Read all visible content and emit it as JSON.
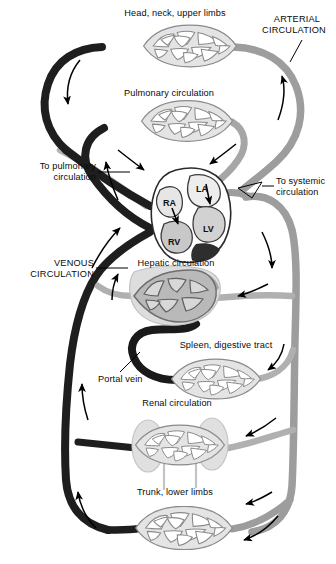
{
  "figure": {
    "title_visible": false,
    "background": "#ffffff"
  },
  "colors": {
    "venous": "#1c1c1c",
    "venous_dark": "#111111",
    "arterial": "#9a9a9a",
    "arterial_light": "#b4b4b4",
    "portal": "#1c1c1c",
    "capillary_fill": "#e2e2e2",
    "capillary_stroke": "#8d8d8d",
    "organ_fill": "#dcdcdc",
    "organ_stroke": "#b0b0b0",
    "heart_outline": "#2a2a2a",
    "chamber_light": "#e6e6e6",
    "chamber_mid": "#c2c2c2",
    "chamber_dark": "#3a3a3a",
    "arrow": "#000000",
    "leader": "#000000",
    "text": "#0b0b0b"
  },
  "labels": {
    "head_neck_upper_limbs": "Head, neck, upper limbs",
    "arterial_circulation_line1": "ARTERIAL",
    "arterial_circulation_line2": "CIRCULATION",
    "pulmonary_circulation": "Pulmonary circulation",
    "to_pulmonary_line1": "To pulmonary",
    "to_pulmonary_line2": "circulation",
    "to_systemic_line1": "To systemic",
    "to_systemic_line2": "circulation",
    "venous_circulation_line1": "VENOUS",
    "venous_circulation_line2": "CIRCULATION",
    "hepatic_circulation": "Hepatic circulation",
    "spleen_digestive_tract": "Spleen, digestive tract",
    "portal_vein": "Portal vein",
    "renal_circulation": "Renal circulation",
    "trunk_lower_limbs": "Trunk, lower limbs"
  },
  "heart": {
    "chambers": [
      {
        "id": "RA",
        "label": "RA",
        "name": "right-atrium"
      },
      {
        "id": "LA",
        "label": "LA",
        "name": "left-atrium"
      },
      {
        "id": "RV",
        "label": "RV",
        "name": "right-ventricle"
      },
      {
        "id": "LV",
        "label": "LV",
        "name": "left-ventricle"
      }
    ]
  },
  "capillary_beds": [
    {
      "name": "head-neck-upper-limbs-capillary-bed",
      "label": "Head, neck, upper limbs"
    },
    {
      "name": "pulmonary-capillary-bed",
      "label": "Pulmonary circulation"
    },
    {
      "name": "hepatic-capillary-bed",
      "label": "Hepatic circulation"
    },
    {
      "name": "spleen-digestive-capillary-bed",
      "label": "Spleen, digestive tract"
    },
    {
      "name": "renal-capillary-bed",
      "label": "Renal circulation"
    },
    {
      "name": "trunk-lower-limbs-capillary-bed",
      "label": "Trunk, lower limbs"
    }
  ],
  "organs": [
    {
      "name": "liver-silhouette",
      "label": "Hepatic circulation"
    },
    {
      "name": "kidney-left-silhouette",
      "label": "Renal circulation"
    },
    {
      "name": "kidney-right-silhouette",
      "label": "Renal circulation"
    }
  ],
  "flow_arrows": [
    {
      "name": "flow-arrow-upper-left-descending",
      "direction": "down"
    },
    {
      "name": "flow-arrow-upper-right-ascending",
      "direction": "up"
    },
    {
      "name": "flow-arrow-pulmonary-left",
      "direction": "down-right"
    },
    {
      "name": "flow-arrow-pulmonary-right",
      "direction": "down-left"
    },
    {
      "name": "flow-arrow-to-pulmonary",
      "direction": "up"
    },
    {
      "name": "flow-arrow-venous-ascending",
      "direction": "up"
    },
    {
      "name": "flow-arrow-venous-lower",
      "direction": "up"
    },
    {
      "name": "flow-arrow-systemic-descending",
      "direction": "down"
    },
    {
      "name": "flow-arrow-hepatic-inflow",
      "direction": "left"
    },
    {
      "name": "flow-arrow-splanchnic-inflow",
      "direction": "down-left"
    },
    {
      "name": "flow-arrow-renal-inflow",
      "direction": "left"
    },
    {
      "name": "flow-arrow-lower-limb-inflow",
      "direction": "left"
    },
    {
      "name": "flow-arrow-bottom-return",
      "direction": "left"
    },
    {
      "name": "flow-arrow-bottom-left-ascending",
      "direction": "up"
    },
    {
      "name": "flow-arrow-tricuspid",
      "direction": "down"
    },
    {
      "name": "flow-arrow-mitral",
      "direction": "down"
    }
  ]
}
